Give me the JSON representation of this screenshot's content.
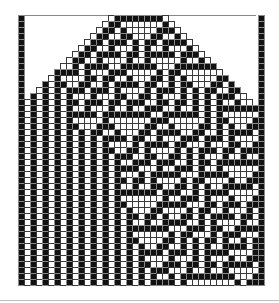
{
  "figure": {
    "cols": 41,
    "rows": 45,
    "cell_px": 6,
    "rule": 30,
    "initial_black_width": 8,
    "boundary_columns_black": true,
    "colors": {
      "black_cell": "#111111",
      "black_cell_border": "#8a8a8a",
      "white_cell": "#ffffff",
      "white_cell_border": "#3a3a3a",
      "background": "#ffffff",
      "bottom_rule": "#bdbdbd"
    }
  }
}
